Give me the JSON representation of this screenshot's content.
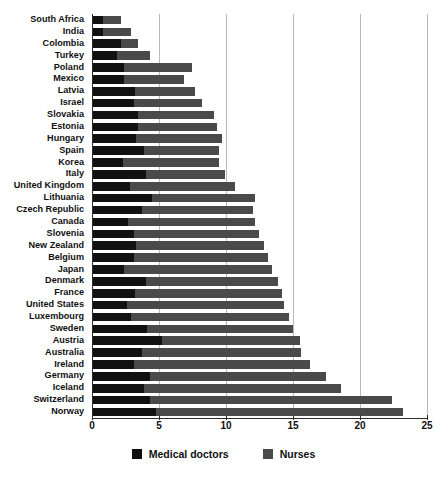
{
  "chart_data": {
    "type": "bar",
    "orientation": "horizontal",
    "stacked": true,
    "title": "",
    "subtitle": "",
    "xlabel": "",
    "ylabel": "",
    "xlim": [
      0,
      25
    ],
    "xticks": [
      0,
      5,
      10,
      15,
      20,
      25
    ],
    "grid": true,
    "legend_position": "bottom",
    "categories": [
      "South Africa",
      "India",
      "Colombia",
      "Turkey",
      "Poland",
      "Mexico",
      "Latvia",
      "Israel",
      "Slovakia",
      "Estonia",
      "Hungary",
      "Spain",
      "Korea",
      "Italy",
      "United Kingdom",
      "Lithuania",
      "Czech Republic",
      "Canada",
      "Slovenia",
      "New Zealand",
      "Belgium",
      "Japan",
      "Denmark",
      "France",
      "United States",
      "Luxembourg",
      "Sweden",
      "Austria",
      "Australia",
      "Ireland",
      "Germany",
      "Iceland",
      "Switzerland",
      "Norway"
    ],
    "series": [
      {
        "name": "Medical doctors",
        "color": "#111111",
        "values": [
          0.8,
          0.8,
          2.2,
          1.9,
          2.4,
          2.4,
          3.2,
          3.1,
          3.4,
          3.4,
          3.3,
          3.9,
          2.3,
          4.0,
          2.8,
          4.5,
          3.7,
          2.7,
          3.1,
          3.3,
          3.1,
          2.4,
          4.0,
          3.2,
          2.6,
          2.9,
          4.1,
          5.2,
          3.7,
          3.1,
          4.3,
          3.9,
          4.3,
          4.8
        ]
      },
      {
        "name": "Nurses",
        "color": "#4a4a4a",
        "values": [
          1.4,
          2.1,
          1.2,
          2.4,
          5.1,
          4.5,
          4.5,
          5.1,
          5.7,
          5.9,
          6.4,
          5.6,
          7.2,
          5.9,
          7.9,
          7.7,
          8.3,
          9.5,
          9.4,
          9.5,
          10.0,
          11.0,
          9.9,
          11.0,
          11.7,
          11.8,
          10.9,
          10.3,
          11.9,
          13.2,
          13.2,
          14.7,
          18.1,
          18.4
        ]
      }
    ],
    "totals": [
      2.2,
      2.9,
      3.4,
      4.3,
      7.5,
      6.9,
      7.7,
      8.2,
      9.1,
      9.3,
      9.7,
      9.5,
      9.5,
      9.9,
      10.7,
      12.2,
      12.0,
      12.2,
      12.5,
      12.8,
      13.1,
      13.4,
      13.9,
      14.2,
      14.3,
      14.7,
      15.0,
      15.5,
      15.6,
      16.3,
      17.5,
      18.6,
      22.4,
      23.2
    ]
  },
  "legend": {
    "items": [
      {
        "label": "Medical doctors",
        "swatch": "legend-swatch-doctors"
      },
      {
        "label": "Nurses",
        "swatch": "legend-swatch-nurses"
      }
    ]
  },
  "axis": {
    "tick_labels": [
      "0",
      "5",
      "10",
      "15",
      "20",
      "25"
    ]
  }
}
